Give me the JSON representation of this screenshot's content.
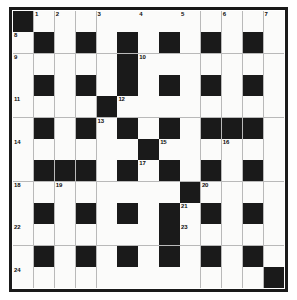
{
  "puzzle": {
    "name": "crossword-grid",
    "rows": 13,
    "columns": 13,
    "colors": {
      "block": "#1a1a1a",
      "cell": "#fbfbfa",
      "border": "#1a1a1a",
      "gridline": "#b9b9b9",
      "number": "#0d0d0d",
      "page_background": "#ffffff"
    },
    "grid": [
      [
        1,
        0,
        0,
        0,
        0,
        0,
        0,
        0,
        0,
        0,
        0,
        0,
        0
      ],
      [
        0,
        1,
        0,
        1,
        0,
        1,
        0,
        1,
        0,
        1,
        0,
        1,
        0
      ],
      [
        0,
        0,
        0,
        0,
        0,
        1,
        0,
        0,
        0,
        0,
        0,
        0,
        0
      ],
      [
        0,
        1,
        0,
        1,
        0,
        1,
        0,
        1,
        0,
        1,
        0,
        1,
        0
      ],
      [
        0,
        0,
        0,
        0,
        1,
        0,
        0,
        0,
        0,
        0,
        0,
        0,
        0
      ],
      [
        0,
        1,
        0,
        1,
        0,
        1,
        0,
        1,
        0,
        1,
        1,
        1,
        0
      ],
      [
        0,
        0,
        0,
        0,
        0,
        0,
        1,
        0,
        0,
        0,
        0,
        0,
        0
      ],
      [
        0,
        1,
        1,
        1,
        0,
        1,
        0,
        1,
        0,
        1,
        0,
        1,
        0
      ],
      [
        0,
        0,
        0,
        0,
        0,
        0,
        0,
        0,
        1,
        0,
        0,
        0,
        0
      ],
      [
        0,
        1,
        0,
        1,
        0,
        1,
        0,
        1,
        0,
        1,
        0,
        1,
        0
      ],
      [
        0,
        0,
        0,
        0,
        0,
        0,
        0,
        1,
        0,
        0,
        0,
        0,
        0
      ],
      [
        0,
        1,
        0,
        1,
        0,
        1,
        0,
        1,
        0,
        1,
        0,
        1,
        0
      ],
      [
        0,
        0,
        0,
        0,
        0,
        0,
        0,
        0,
        0,
        0,
        0,
        0,
        1
      ]
    ],
    "numbers": [
      {
        "row": 0,
        "col": 1,
        "label": "1"
      },
      {
        "row": 0,
        "col": 2,
        "label": "2"
      },
      {
        "row": 0,
        "col": 4,
        "label": "3"
      },
      {
        "row": 0,
        "col": 6,
        "label": "4"
      },
      {
        "row": 0,
        "col": 8,
        "label": "5"
      },
      {
        "row": 0,
        "col": 10,
        "label": "6"
      },
      {
        "row": 0,
        "col": 12,
        "label": "7"
      },
      {
        "row": 1,
        "col": 0,
        "label": "8"
      },
      {
        "row": 2,
        "col": 0,
        "label": "9"
      },
      {
        "row": 2,
        "col": 6,
        "label": "10"
      },
      {
        "row": 4,
        "col": 0,
        "label": "11"
      },
      {
        "row": 4,
        "col": 5,
        "label": "12"
      },
      {
        "row": 5,
        "col": 4,
        "label": "13"
      },
      {
        "row": 6,
        "col": 0,
        "label": "14"
      },
      {
        "row": 6,
        "col": 7,
        "label": "15"
      },
      {
        "row": 6,
        "col": 10,
        "label": "16"
      },
      {
        "row": 7,
        "col": 6,
        "label": "17"
      },
      {
        "row": 8,
        "col": 0,
        "label": "18"
      },
      {
        "row": 8,
        "col": 2,
        "label": "19"
      },
      {
        "row": 8,
        "col": 9,
        "label": "20"
      },
      {
        "row": 9,
        "col": 8,
        "label": "21"
      },
      {
        "row": 10,
        "col": 0,
        "label": "22"
      },
      {
        "row": 10,
        "col": 8,
        "label": "23"
      },
      {
        "row": 12,
        "col": 0,
        "label": "24"
      }
    ]
  }
}
